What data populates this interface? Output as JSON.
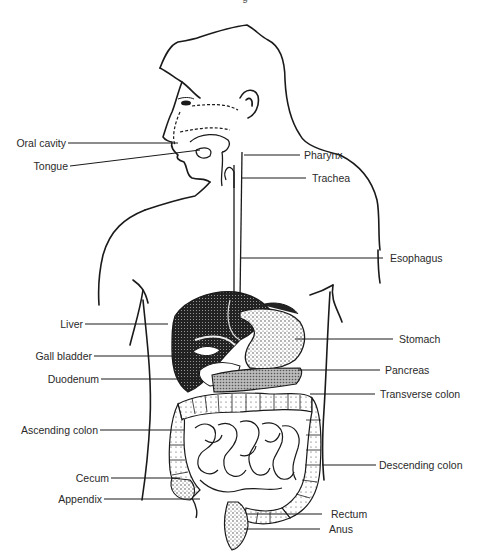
{
  "diagram": {
    "top_caption_fragment": "g",
    "line_color": "#1a1a1a",
    "shading_color": "#3a3a3a",
    "background": "#ffffff",
    "labels_left": [
      {
        "id": "oral-cavity",
        "text": "Oral cavity"
      },
      {
        "id": "tongue",
        "text": "Tongue"
      },
      {
        "id": "liver",
        "text": "Liver"
      },
      {
        "id": "gall-bladder",
        "text": "Gall bladder"
      },
      {
        "id": "duodenum",
        "text": "Duodenum"
      },
      {
        "id": "ascending-colon",
        "text": "Ascending colon"
      },
      {
        "id": "cecum",
        "text": "Cecum"
      },
      {
        "id": "appendix",
        "text": "Appendix"
      }
    ],
    "labels_right": [
      {
        "id": "pharynx",
        "text": "Pharynx"
      },
      {
        "id": "trachea",
        "text": "Trachea"
      },
      {
        "id": "esophagus",
        "text": "Esophagus"
      },
      {
        "id": "stomach",
        "text": "Stomach"
      },
      {
        "id": "pancreas",
        "text": "Pancreas"
      },
      {
        "id": "transverse-colon",
        "text": "Transverse colon"
      },
      {
        "id": "descending-colon",
        "text": "Descending colon"
      },
      {
        "id": "rectum",
        "text": "Rectum"
      },
      {
        "id": "anus",
        "text": "Anus"
      }
    ]
  }
}
